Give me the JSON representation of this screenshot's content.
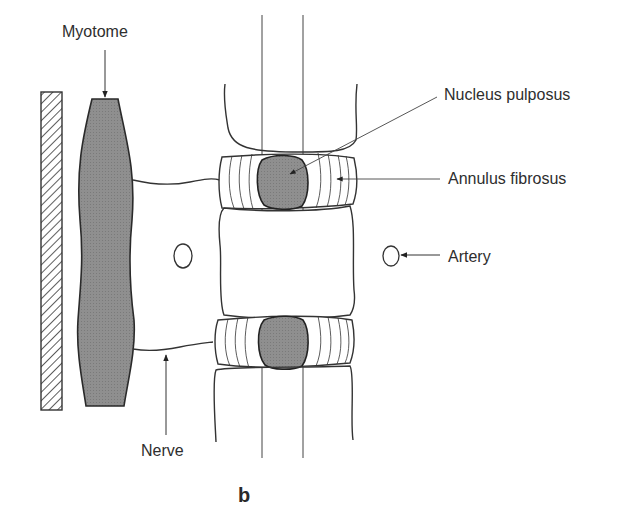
{
  "figure": {
    "panel_label": "b",
    "labels": {
      "myotome": "Myotome",
      "nucleus_pulposus": "Nucleus pulposus",
      "annulus_fibrosus": "Annulus fibrosus",
      "artery": "Artery",
      "nerve": "Nerve"
    },
    "colors": {
      "stroke": "#333333",
      "fill_grey": "#8f8f8f",
      "background": "#ffffff"
    }
  }
}
